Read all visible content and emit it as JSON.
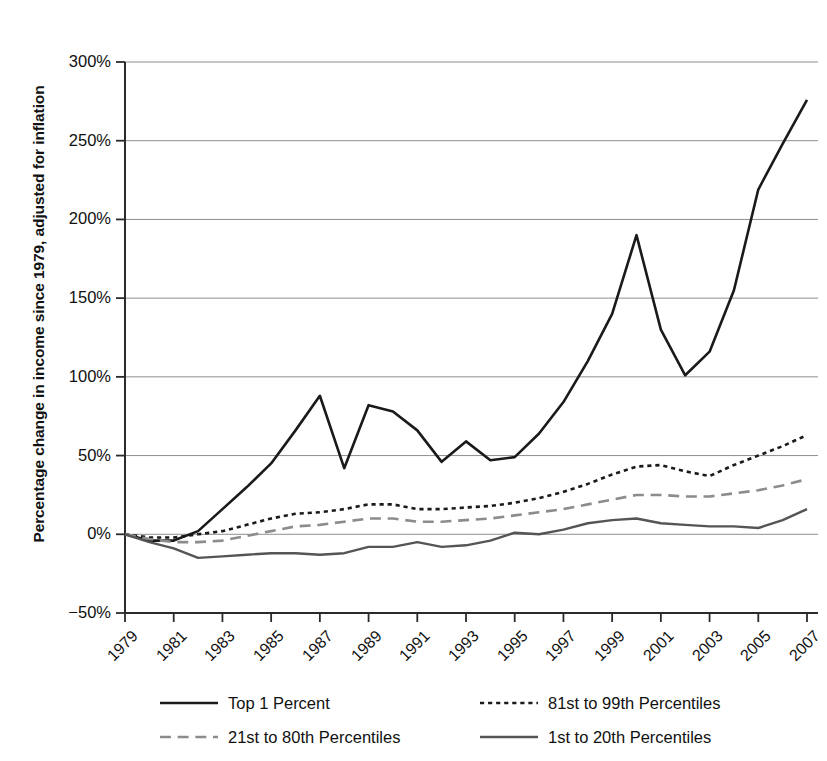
{
  "chart_data": {
    "type": "line",
    "title": "",
    "xlabel": "",
    "ylabel": "Percentage change in income since 1979, adjusted for inflation",
    "xlim": [
      1979,
      2007
    ],
    "ylim": [
      -50,
      300
    ],
    "ytick_labels": [
      "300%",
      "250%",
      "200%",
      "150%",
      "100%",
      "50%",
      "0%",
      "−50%"
    ],
    "ytick_values": [
      300,
      250,
      200,
      150,
      100,
      50,
      0,
      -50
    ],
    "ytick_step": 50,
    "xtick_labels": [
      "1979",
      "1981",
      "1983",
      "1985",
      "1987",
      "1989",
      "1991",
      "1993",
      "1995",
      "1997",
      "1999",
      "2001",
      "2003",
      "2005",
      "2007"
    ],
    "xtick_values": [
      1979,
      1981,
      1983,
      1985,
      1987,
      1989,
      1991,
      1993,
      1995,
      1997,
      1999,
      2001,
      2003,
      2005,
      2007
    ],
    "grid": "horizontal",
    "legend_position": "bottom",
    "x": [
      1979,
      1980,
      1981,
      1982,
      1983,
      1984,
      1985,
      1986,
      1987,
      1988,
      1989,
      1990,
      1991,
      1992,
      1993,
      1994,
      1995,
      1996,
      1997,
      1998,
      1999,
      2000,
      2001,
      2002,
      2003,
      2004,
      2005,
      2006,
      2007
    ],
    "series": [
      {
        "name": "Top 1 Percent",
        "style": "solid",
        "color": "#1a1a1a",
        "width": 2.6,
        "values": [
          0,
          -4,
          -4,
          2,
          16,
          30,
          45,
          66,
          88,
          42,
          82,
          78,
          66,
          46,
          59,
          47,
          49,
          64,
          84,
          110,
          140,
          190,
          130,
          101,
          116,
          155,
          219,
          248,
          276
        ]
      },
      {
        "name": "81st to 99th Percentiles",
        "style": "dotted",
        "color": "#1a1a1a",
        "width": 2.6,
        "values": [
          0,
          -2,
          -2,
          0,
          2,
          6,
          10,
          13,
          14,
          16,
          19,
          19,
          16,
          16,
          17,
          18,
          20,
          23,
          27,
          32,
          38,
          43,
          44,
          40,
          37,
          44,
          50,
          56,
          63
        ]
      },
      {
        "name": "21st to 80th Percentiles",
        "style": "dashed",
        "color": "#8c8c8c",
        "width": 2.6,
        "values": [
          0,
          -3,
          -5,
          -5,
          -4,
          -1,
          2,
          5,
          6,
          8,
          10,
          10,
          8,
          8,
          9,
          10,
          12,
          14,
          16,
          19,
          22,
          25,
          25,
          24,
          24,
          26,
          28,
          31,
          35
        ]
      },
      {
        "name": "1st to 20th Percentiles",
        "style": "solid",
        "color": "#555555",
        "width": 2.4,
        "values": [
          0,
          -5,
          -9,
          -15,
          -14,
          -13,
          -12,
          -12,
          -13,
          -12,
          -8,
          -8,
          -5,
          -8,
          -7,
          -4,
          1,
          0,
          3,
          7,
          9,
          10,
          7,
          6,
          5,
          5,
          4,
          9,
          16
        ]
      }
    ]
  },
  "legend": {
    "items": [
      {
        "label": "Top 1 Percent"
      },
      {
        "label": "81st to 99th Percentiles"
      },
      {
        "label": "21st to 80th Percentiles"
      },
      {
        "label": "1st to 20th Percentiles"
      }
    ]
  }
}
